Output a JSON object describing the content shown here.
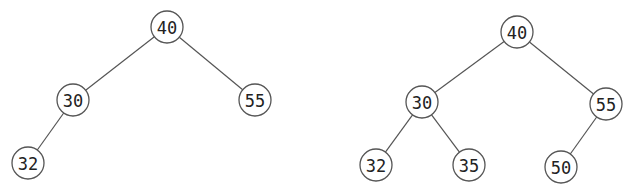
{
  "diagram": {
    "type": "binary-search-tree-comparison",
    "node_radius": 16,
    "colors": {
      "stroke": "#555555",
      "text": "#222222",
      "fill": "#ffffff",
      "background": "#ffffff"
    },
    "trees": [
      {
        "id": "left-tree",
        "nodes": [
          {
            "id": "l40",
            "label": "40",
            "x": 167,
            "y": 27
          },
          {
            "id": "l30",
            "label": "30",
            "x": 73,
            "y": 100
          },
          {
            "id": "l55",
            "label": "55",
            "x": 255,
            "y": 100
          },
          {
            "id": "l32",
            "label": "32",
            "x": 28,
            "y": 163
          }
        ],
        "edges": [
          {
            "from": "l40",
            "to": "l30"
          },
          {
            "from": "l40",
            "to": "l55"
          },
          {
            "from": "l30",
            "to": "l32"
          }
        ]
      },
      {
        "id": "right-tree",
        "nodes": [
          {
            "id": "r40",
            "label": "40",
            "x": 517,
            "y": 32
          },
          {
            "id": "r30",
            "label": "30",
            "x": 422,
            "y": 102
          },
          {
            "id": "r55",
            "label": "55",
            "x": 606,
            "y": 104
          },
          {
            "id": "r32",
            "label": "32",
            "x": 376,
            "y": 165
          },
          {
            "id": "r35",
            "label": "35",
            "x": 469,
            "y": 165
          },
          {
            "id": "r50",
            "label": "50",
            "x": 561,
            "y": 167
          }
        ],
        "edges": [
          {
            "from": "r40",
            "to": "r30"
          },
          {
            "from": "r40",
            "to": "r55"
          },
          {
            "from": "r30",
            "to": "r32"
          },
          {
            "from": "r30",
            "to": "r35"
          },
          {
            "from": "r55",
            "to": "r50"
          }
        ]
      }
    ]
  }
}
